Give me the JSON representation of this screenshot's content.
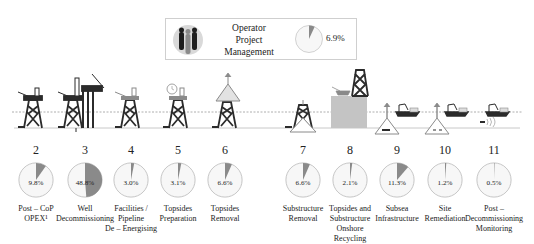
{
  "operator": {
    "label_lines": [
      "Operator",
      "Project",
      "Management"
    ],
    "percent_label": "6.9%",
    "percent": 6.9,
    "icon": "people-icon"
  },
  "colors": {
    "slice": "#8a8a8a",
    "pie_bg": "#f7f7f7",
    "pie_border": "#b5b5b5",
    "structure": "#2b2b2b",
    "water_line": "#9a9a9a",
    "seabed_line": "#c8c8c8",
    "highlight": "#bdbdbd"
  },
  "stages": [
    {
      "num": "2",
      "percent": 9.8,
      "percent_label": "9.8%",
      "desc_lines": [
        "Post – CoP",
        "OPEX¹"
      ],
      "icon": "jacket-platform-icon"
    },
    {
      "num": "3",
      "percent": 48.8,
      "percent_label": "48.8%",
      "desc_lines": [
        "Well",
        "Decommissioning"
      ],
      "icon": "drilling-rig-icon"
    },
    {
      "num": "4",
      "percent": 3.0,
      "percent_label": "3.0%",
      "desc_lines": [
        "Facilities /",
        "Pipeline",
        "De – Energising"
      ],
      "icon": "platform-energising-icon"
    },
    {
      "num": "5",
      "percent": 3.1,
      "percent_label": "3.1%",
      "desc_lines": [
        "Topsides",
        "Preparation"
      ],
      "icon": "platform-clock-icon"
    },
    {
      "num": "6",
      "percent": 6.6,
      "percent_label": "6.6%",
      "desc_lines": [
        "Topsides",
        "Removal"
      ],
      "icon": "topsides-lift-icon"
    },
    {
      "num": "7",
      "percent": 6.6,
      "percent_label": "6.6%",
      "desc_lines": [
        "Substructure",
        "Removal"
      ],
      "icon": "substructure-lift-icon"
    },
    {
      "num": "8",
      "percent": 2.1,
      "percent_label": "2.1%",
      "desc_lines": [
        "Topsides and",
        "Substructure",
        "Onshore",
        "Recycling"
      ],
      "icon": "onshore-recycling-icon"
    },
    {
      "num": "9",
      "percent": 11.3,
      "percent_label": "11.3%",
      "desc_lines": [
        "Subsea",
        "Infrastructure"
      ],
      "icon": "subsea-vessel-icon"
    },
    {
      "num": "10",
      "percent": 1.2,
      "percent_label": "1.2%",
      "desc_lines": [
        "Site",
        "Remediation"
      ],
      "icon": "site-remediation-icon"
    },
    {
      "num": "11",
      "percent": 0.5,
      "percent_label": "0.5%",
      "desc_lines": [
        "Post –",
        "Decommissioning",
        "Monitoring"
      ],
      "icon": "monitoring-vessel-icon"
    }
  ]
}
